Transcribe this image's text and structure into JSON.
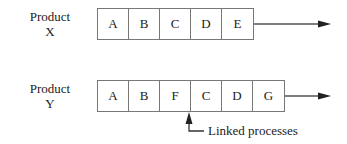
{
  "diagram": {
    "rows": [
      {
        "label_line1": "Product",
        "label_line2": "X",
        "steps": [
          "A",
          "B",
          "C",
          "D",
          "E"
        ]
      },
      {
        "label_line1": "Product",
        "label_line2": "Y",
        "steps": [
          "A",
          "B",
          "F",
          "C",
          "D",
          "G"
        ]
      }
    ],
    "annotation": "Linked processes",
    "colors": {
      "line": "#777777",
      "arrow": "#222222",
      "text": "#222222"
    }
  }
}
